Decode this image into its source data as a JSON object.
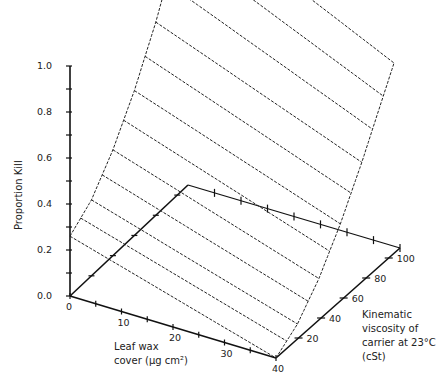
{
  "chart_data": {
    "type": "surface3d",
    "title": "",
    "zlabel": "Proportion Kill",
    "xlabel_lines": [
      "Leaf wax",
      "cover (µg cm²)"
    ],
    "ylabel_lines": [
      "Kinematic",
      "viscosity of",
      "carrier at 23°C",
      "(cSt)"
    ],
    "z_ticks": [
      "0.0",
      "0.2",
      "0.4",
      "0.6",
      "0.8",
      "1.0"
    ],
    "x_ticks": [
      "0",
      "10",
      "20",
      "30",
      "40"
    ],
    "y_ticks": [
      "20",
      "40",
      "60",
      "80",
      "100"
    ],
    "zlim": [
      0,
      1.0
    ],
    "xlim": [
      0,
      40
    ],
    "ylim": [
      0,
      110
    ],
    "surface": {
      "description": "Proportion kill rises with viscosity and declines slightly with leaf wax cover",
      "edge_wax0": [
        {
          "viscosity": 0,
          "kill": 0.26
        },
        {
          "viscosity": 20,
          "kill": 0.33
        },
        {
          "viscosity": 40,
          "kill": 0.46
        },
        {
          "viscosity": 60,
          "kill": 0.63
        },
        {
          "viscosity": 80,
          "kill": 0.84
        },
        {
          "viscosity": 110,
          "kill": 1.22
        }
      ],
      "edge_wax40": [
        {
          "viscosity": 0,
          "kill": 0.0
        },
        {
          "viscosity": 20,
          "kill": 0.06
        },
        {
          "viscosity": 40,
          "kill": 0.17
        },
        {
          "viscosity": 60,
          "kill": 0.32
        },
        {
          "viscosity": 80,
          "kill": 0.5
        },
        {
          "viscosity": 110,
          "kill": 0.8
        }
      ],
      "contour_count": 12
    }
  },
  "labels": {
    "z_axis": "Proportion Kill",
    "x_axis_line1": "Leaf wax",
    "x_axis_line2": "cover (µg cm²)",
    "y_axis_line1": "Kinematic",
    "y_axis_line2": "viscosity of",
    "y_axis_line3": "carrier at 23°C",
    "y_axis_line4": "(cSt)"
  }
}
